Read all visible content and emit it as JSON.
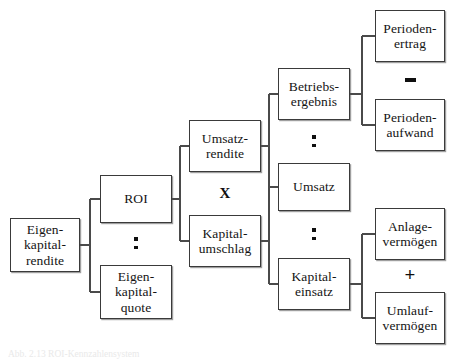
{
  "diagram": {
    "nodes": [
      {
        "id": "eigenkapitalrendite",
        "label": "Eigen-\nkapital-\nrendite",
        "x": 10,
        "y": 218,
        "w": 70,
        "h": 54
      },
      {
        "id": "roi",
        "label": "ROI",
        "x": 100,
        "y": 175,
        "w": 72,
        "h": 48
      },
      {
        "id": "eigenkapitalquote",
        "label": "Eigen-\nkapital-\nquote",
        "x": 100,
        "y": 265,
        "w": 72,
        "h": 54
      },
      {
        "id": "umsatzrendite",
        "label": "Umsatz-\nrendite",
        "x": 189,
        "y": 120,
        "w": 72,
        "h": 52
      },
      {
        "id": "kapitalumschlag",
        "label": "Kapital-\numschlag",
        "x": 189,
        "y": 215,
        "w": 72,
        "h": 52
      },
      {
        "id": "betriebsergebnis",
        "label": "Betriebs-\nergebnis",
        "x": 278,
        "y": 68,
        "w": 72,
        "h": 52
      },
      {
        "id": "umsatz",
        "label": "Umsatz",
        "x": 278,
        "y": 163,
        "w": 72,
        "h": 48
      },
      {
        "id": "kapitaleinsatz",
        "label": "Kapital-\neinsatz",
        "x": 278,
        "y": 258,
        "w": 72,
        "h": 52
      },
      {
        "id": "periodenertrag",
        "label": "Perioden-\nertrag",
        "x": 375,
        "y": 10,
        "w": 70,
        "h": 52
      },
      {
        "id": "periodenaufwand",
        "label": "Perioden-\naufwand",
        "x": 375,
        "y": 99,
        "w": 70,
        "h": 52
      },
      {
        "id": "anlagevermoegen",
        "label": "Anlage-\nvermögen",
        "x": 375,
        "y": 208,
        "w": 70,
        "h": 52
      },
      {
        "id": "umlaufvermoegen",
        "label": "Umlauf-\nvermögen",
        "x": 375,
        "y": 292,
        "w": 70,
        "h": 52
      }
    ],
    "operators": [
      {
        "id": "op-roi-ekquote",
        "kind": "divide",
        "symbol": "÷",
        "x": 124,
        "y": 232,
        "w": 24,
        "h": 22
      },
      {
        "id": "op-rendite-umschlag",
        "kind": "times",
        "symbol": "X",
        "x": 213,
        "y": 182,
        "w": 24,
        "h": 22
      },
      {
        "id": "op-ergebnis-umsatz",
        "kind": "divide",
        "symbol": "÷",
        "x": 302,
        "y": 130,
        "w": 24,
        "h": 22
      },
      {
        "id": "op-umsatz-einsatz",
        "kind": "divide",
        "symbol": "÷",
        "x": 302,
        "y": 223,
        "w": 24,
        "h": 22
      },
      {
        "id": "op-ertrag-aufwand",
        "kind": "minus",
        "symbol": "–",
        "x": 398,
        "y": 69,
        "w": 24,
        "h": 22
      },
      {
        "id": "op-anlage-umlauf",
        "kind": "plus",
        "symbol": "+",
        "x": 398,
        "y": 263,
        "w": 24,
        "h": 22
      }
    ],
    "connectors": [
      {
        "id": "conn-ekrendite",
        "from": "eigenkapitalrendite",
        "to": [
          "roi",
          "eigenkapitalquote"
        ],
        "x1": 80,
        "spine": 90,
        "x2": 100,
        "y_from": 245,
        "y_children": [
          199,
          292
        ]
      },
      {
        "id": "conn-roi",
        "from": "roi",
        "to": [
          "umsatzrendite",
          "kapitalumschlag"
        ],
        "x1": 172,
        "spine": 180,
        "x2": 189,
        "y_from": 199,
        "y_children": [
          146,
          241
        ]
      },
      {
        "id": "conn-umsatzrendite",
        "from": "umsatzrendite",
        "to": [
          "betriebsergebnis",
          "umsatz"
        ],
        "x1": 261,
        "spine": 269,
        "x2": 278,
        "y_from": 146,
        "y_children": [
          94,
          187
        ]
      },
      {
        "id": "conn-kapitalumschlag",
        "from": "kapitalumschlag",
        "to": [
          "umsatz",
          "kapitaleinsatz"
        ],
        "x1": 261,
        "spine": 269,
        "x2": 278,
        "y_from": 241,
        "y_children": [
          187,
          284
        ]
      },
      {
        "id": "conn-betriebsergebnis",
        "from": "betriebsergebnis",
        "to": [
          "periodenertrag",
          "periodenaufwand"
        ],
        "x1": 350,
        "spine": 362,
        "x2": 375,
        "y_from": 94,
        "y_children": [
          36,
          125
        ]
      },
      {
        "id": "conn-kapitaleinsatz",
        "from": "kapitaleinsatz",
        "to": [
          "anlagevermoegen",
          "umlaufvermoegen"
        ],
        "x1": 350,
        "spine": 362,
        "x2": 375,
        "y_from": 284,
        "y_children": [
          234,
          318
        ]
      }
    ]
  },
  "caption": {
    "text": "Abb. 2.13 ROI-Kennzahlensystem"
  }
}
